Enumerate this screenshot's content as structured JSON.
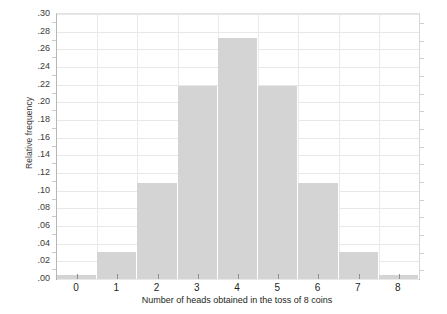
{
  "chart_data": {
    "type": "bar",
    "title": "",
    "subtitle": "",
    "xlabel": "Number of heads obtained in the toss of 8 coins",
    "ylabel": "Relative frequency",
    "categories": [
      "0",
      "1",
      "2",
      "3",
      "4",
      "5",
      "6",
      "7",
      "8"
    ],
    "values": [
      0.004,
      0.031,
      0.109,
      0.219,
      0.273,
      0.219,
      0.109,
      0.031,
      0.004
    ],
    "series": [
      {
        "name": "Relative frequency",
        "values": [
          0.004,
          0.031,
          0.109,
          0.219,
          0.273,
          0.219,
          0.109,
          0.031,
          0.004
        ]
      }
    ],
    "xlim": [
      -0.5,
      8.5
    ],
    "ylim": [
      0.0,
      0.3
    ],
    "ytick_values": [
      0.0,
      0.02,
      0.04,
      0.06,
      0.08,
      0.1,
      0.12,
      0.14,
      0.16,
      0.18,
      0.2,
      0.22,
      0.24,
      0.26,
      0.28,
      0.3
    ],
    "ytick_labels": [
      ".00",
      ".02",
      ".04",
      ".06",
      ".08",
      ".10",
      ".12",
      ".14",
      ".16",
      ".18",
      ".20",
      ".22",
      ".24",
      ".26",
      ".28",
      ".30"
    ],
    "xtick_labels": [
      "0",
      "1",
      "2",
      "3",
      "4",
      "5",
      "6",
      "7",
      "8"
    ],
    "grid": true,
    "grid_axis": "both",
    "legend": false,
    "legend_position": "none",
    "bar_color": "#d4d4d4",
    "bar_edge_color": "#ffffff",
    "grid_color": "#e8e8e8",
    "axis_color": "#9a9a9a",
    "background_color": "#ffffff",
    "text_color": "#231f20",
    "annotations": []
  },
  "caption": {
    "fragment": ""
  }
}
